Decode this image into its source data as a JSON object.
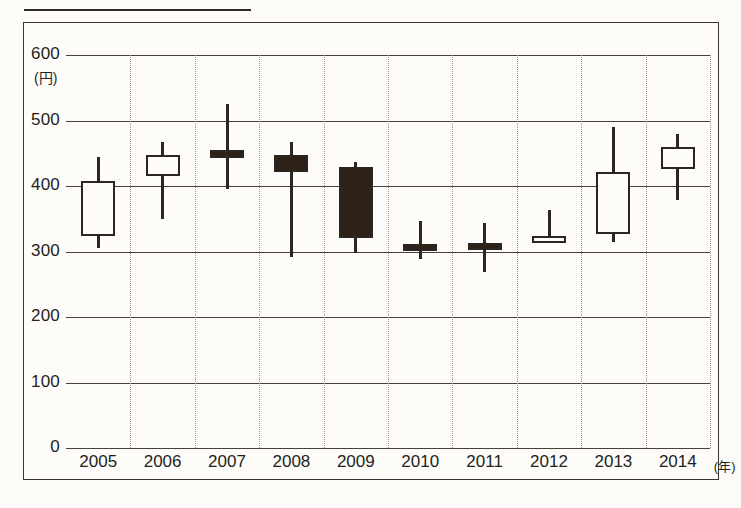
{
  "figure": {
    "y_unit_label": "(円)",
    "x_unit_label": "(年)"
  },
  "chart_data": {
    "type": "candlestick",
    "title": "",
    "xlabel": "(年)",
    "ylabel": "(円)",
    "ylim": [
      0,
      600
    ],
    "yticks": [
      0,
      100,
      200,
      300,
      400,
      500,
      600
    ],
    "ytick_labels": [
      "0",
      "100",
      "200",
      "300",
      "400",
      "500",
      "600"
    ],
    "grid": "horizontal solid, vertical dotted",
    "legend": "none",
    "categories": [
      "2005",
      "2006",
      "2007",
      "2008",
      "2009",
      "2010",
      "2011",
      "2012",
      "2013",
      "2014"
    ],
    "series": [
      {
        "name": "年間値動き",
        "points": [
          {
            "x": "2005",
            "open": 324,
            "high": 444,
            "low": 306,
            "close": 407,
            "direction": "up",
            "fill": "white"
          },
          {
            "x": "2006",
            "open": 416,
            "high": 467,
            "low": 350,
            "close": 448,
            "direction": "up",
            "fill": "white"
          },
          {
            "x": "2007",
            "open": 455,
            "high": 525,
            "low": 396,
            "close": 442,
            "direction": "down",
            "fill": "black"
          },
          {
            "x": "2008",
            "open": 447,
            "high": 467,
            "low": 291,
            "close": 421,
            "direction": "down",
            "fill": "black"
          },
          {
            "x": "2009",
            "open": 429,
            "high": 436,
            "low": 298,
            "close": 321,
            "direction": "down",
            "fill": "black"
          },
          {
            "x": "2010",
            "open": 312,
            "high": 347,
            "low": 288,
            "close": 310,
            "direction": "down",
            "fill": "black"
          },
          {
            "x": "2011",
            "open": 313,
            "high": 344,
            "low": 269,
            "close": 311,
            "direction": "down",
            "fill": "black"
          },
          {
            "x": "2012",
            "open": 315,
            "high": 364,
            "low": 315,
            "close": 324,
            "direction": "up",
            "fill": "white"
          },
          {
            "x": "2013",
            "open": 326,
            "high": 490,
            "low": 315,
            "close": 421,
            "direction": "up",
            "fill": "white"
          },
          {
            "x": "2014",
            "open": 426,
            "high": 479,
            "low": 378,
            "close": 459,
            "direction": "up",
            "fill": "white"
          }
        ]
      }
    ]
  },
  "axis": {
    "y_labels": [
      "600",
      "500",
      "400",
      "300",
      "200",
      "100",
      "0"
    ],
    "x_labels": [
      "2005",
      "2006",
      "2007",
      "2008",
      "2009",
      "2010",
      "2011",
      "2012",
      "2013",
      "2014"
    ]
  },
  "colors": {
    "ink": "#2b2622",
    "grid": "#45403a",
    "dotted_grid": "#9a948a",
    "bullish_fill": "#fdfcf9",
    "bearish_fill": "#2e2218",
    "paper": "#fcfbf8"
  }
}
